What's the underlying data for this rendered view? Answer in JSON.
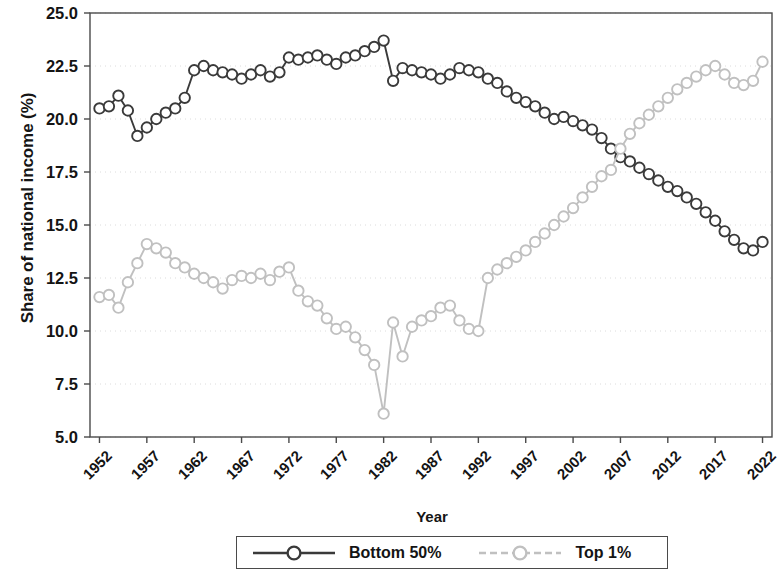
{
  "chart_data": {
    "type": "line",
    "title": "",
    "xlabel": "Year",
    "ylabel": "Share of national income (%)",
    "xlim": [
      1951,
      2023
    ],
    "ylim": [
      5.0,
      25.0
    ],
    "grid": true,
    "grid_style": "faint dotted horizontal at major y ticks",
    "legend_position": "below axes, centered",
    "ytick_labels": [
      "25.0",
      "22.5",
      "20.0",
      "17.5",
      "15.0",
      "12.5",
      "10.0",
      "7.5",
      "5.0"
    ],
    "ytick_values": [
      25.0,
      22.5,
      20.0,
      17.5,
      15.0,
      12.5,
      10.0,
      7.5,
      5.0
    ],
    "xtick_labels": [
      "1952",
      "1957",
      "1962",
      "1967",
      "1972",
      "1977",
      "1982",
      "1987",
      "1992",
      "1997",
      "2002",
      "2007",
      "2012",
      "2017",
      "2022"
    ],
    "xtick_values": [
      1952,
      1957,
      1962,
      1967,
      1972,
      1977,
      1982,
      1987,
      1992,
      1997,
      2002,
      2007,
      2012,
      2017,
      2022
    ],
    "x": [
      1952,
      1953,
      1954,
      1955,
      1956,
      1957,
      1958,
      1959,
      1960,
      1961,
      1962,
      1963,
      1964,
      1965,
      1966,
      1967,
      1968,
      1969,
      1970,
      1971,
      1972,
      1973,
      1974,
      1975,
      1976,
      1977,
      1978,
      1979,
      1980,
      1981,
      1982,
      1983,
      1984,
      1985,
      1986,
      1987,
      1988,
      1989,
      1990,
      1991,
      1992,
      1993,
      1994,
      1995,
      1996,
      1997,
      1998,
      1999,
      2000,
      2001,
      2002,
      2003,
      2004,
      2005,
      2006,
      2007,
      2008,
      2009,
      2010,
      2011,
      2012,
      2013,
      2014,
      2015,
      2016,
      2017,
      2018,
      2019,
      2020,
      2021,
      2022
    ],
    "series": [
      {
        "name": "Bottom 50%",
        "color": "#3a3a3a",
        "marker": "open-circle",
        "linestyle": "solid",
        "values": [
          20.5,
          20.6,
          21.1,
          20.4,
          19.2,
          19.6,
          20.0,
          20.3,
          20.5,
          21.0,
          22.3,
          22.5,
          22.3,
          22.2,
          22.1,
          21.9,
          22.1,
          22.3,
          22.0,
          22.2,
          22.9,
          22.8,
          22.9,
          23.0,
          22.8,
          22.6,
          22.9,
          23.0,
          23.2,
          23.4,
          23.7,
          21.8,
          22.4,
          22.3,
          22.2,
          22.1,
          21.9,
          22.1,
          22.4,
          22.3,
          22.2,
          21.9,
          21.7,
          21.3,
          21.0,
          20.8,
          20.6,
          20.3,
          20.0,
          20.1,
          19.9,
          19.7,
          19.5,
          19.1,
          18.6,
          18.2,
          18.0,
          17.7,
          17.4,
          17.1,
          16.8,
          16.6,
          16.3,
          16.0,
          15.6,
          15.2,
          14.7,
          14.3,
          13.9,
          13.8,
          14.2
        ]
      },
      {
        "name": "Top 1%",
        "color": "#c0c0c0",
        "marker": "open-circle",
        "linestyle": "solid",
        "values": [
          11.6,
          11.7,
          11.1,
          12.3,
          13.2,
          14.1,
          13.9,
          13.7,
          13.2,
          13.0,
          12.7,
          12.5,
          12.3,
          12.0,
          12.4,
          12.6,
          12.5,
          12.7,
          12.4,
          12.8,
          13.0,
          11.9,
          11.4,
          11.2,
          10.6,
          10.1,
          10.2,
          9.7,
          9.1,
          8.4,
          6.1,
          10.4,
          8.8,
          10.2,
          10.5,
          10.7,
          11.1,
          11.2,
          10.5,
          10.1,
          10.0,
          12.5,
          12.9,
          13.2,
          13.5,
          13.8,
          14.2,
          14.6,
          15.0,
          15.4,
          15.8,
          16.3,
          16.8,
          17.3,
          17.6,
          18.6,
          19.3,
          19.8,
          20.2,
          20.6,
          21.0,
          21.4,
          21.7,
          22.0,
          22.3,
          22.5,
          22.1,
          21.7,
          21.6,
          21.8,
          22.7
        ]
      }
    ]
  },
  "legend": {
    "items": [
      {
        "label": "Bottom 50%"
      },
      {
        "label": "Top 1%"
      }
    ]
  }
}
